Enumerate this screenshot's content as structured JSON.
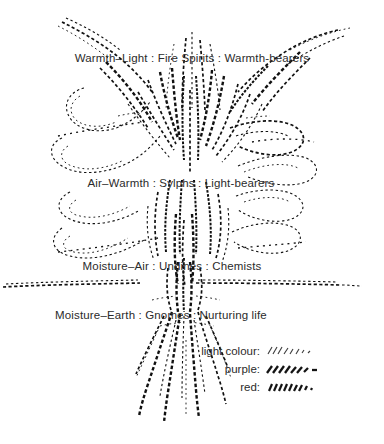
{
  "figure": {
    "background_colour": "#ffffff",
    "ink_colour": "#1a1a1a",
    "text_colour": "#2b2b2b",
    "width": 384,
    "height": 444
  },
  "annotations": [
    {
      "id": "fire-spirits",
      "text": "Warmth–Light : Fire Spirits : Warmth-bearers",
      "element": "Warmth–Light",
      "beings": "Fire Spirits",
      "role": "Warmth-bearers",
      "x": 192,
      "y": 52
    },
    {
      "id": "sylphs",
      "text": "Air–Warmth : Sylphs : Light-bearers",
      "element": "Air–Warmth",
      "beings": "Sylphs",
      "role": "Light-bearers",
      "x": 181,
      "y": 177
    },
    {
      "id": "undines",
      "text": "Moisture–Air : Undines : Chemists",
      "element": "Moisture–Air",
      "beings": "Undines",
      "role": "Chemists",
      "x": 172,
      "y": 260
    },
    {
      "id": "gnomes",
      "text": "Moisture–Earth : Gnomes : Nurturing life",
      "element": "Moisture–Earth",
      "beings": "Gnomes",
      "role": "Nurturing life",
      "x": 161,
      "y": 309
    }
  ],
  "legend": {
    "items": [
      {
        "id": "light-colour",
        "label": "light colour:",
        "swatch": "thin-forward-hatch",
        "colour": "#3a3a3a"
      },
      {
        "id": "purple",
        "label": "purple:",
        "swatch": "thick-forward-hatch",
        "colour": "#1a1a1a"
      },
      {
        "id": "red",
        "label": "red:",
        "swatch": "dense-back-hatch",
        "colour": "#1a1a1a"
      }
    ]
  },
  "ground_line": {
    "id": "soil-surface",
    "description": "horizontal hatched soil line",
    "y": 284,
    "x_start": 2,
    "x_end": 360
  }
}
